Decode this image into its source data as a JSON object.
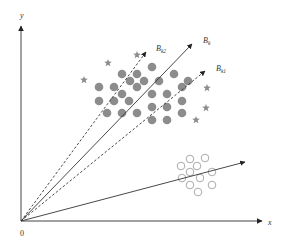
{
  "diagram": {
    "title": "",
    "origin": {
      "x": 21,
      "y": 221
    },
    "axes": {
      "x_label": "x",
      "y_label": "y",
      "origin_label": "0"
    },
    "vectors": [
      {
        "id": "Bk",
        "label": "B",
        "subscript": "k",
        "style": "solid",
        "end": [
          192,
          44
        ],
        "label_pos": [
          203,
          43
        ]
      },
      {
        "id": "Bk2",
        "label": "B",
        "subscript": "k2",
        "style": "dashed",
        "end": [
          146,
          52
        ],
        "label_pos": [
          156,
          51
        ]
      },
      {
        "id": "Bk1",
        "label": "B",
        "subscript": "k1",
        "style": "dashed",
        "end": [
          205,
          71
        ],
        "label_pos": [
          216,
          71
        ]
      },
      {
        "id": "lower",
        "label": "",
        "subscript": "",
        "style": "solid",
        "end": [
          245,
          162
        ],
        "label_pos": null
      }
    ],
    "filled_points": [
      [
        152,
        67
      ],
      [
        122,
        74
      ],
      [
        137,
        74
      ],
      [
        174,
        74
      ],
      [
        130,
        81
      ],
      [
        144,
        81
      ],
      [
        159,
        81
      ],
      [
        188,
        81
      ],
      [
        99,
        87
      ],
      [
        114,
        87
      ],
      [
        137,
        87
      ],
      [
        182,
        87
      ],
      [
        122,
        94
      ],
      [
        152,
        94
      ],
      [
        167,
        94
      ],
      [
        99,
        101
      ],
      [
        114,
        101
      ],
      [
        129,
        101
      ],
      [
        182,
        101
      ],
      [
        152,
        107
      ],
      [
        167,
        107
      ],
      [
        107,
        113
      ],
      [
        122,
        113
      ],
      [
        137,
        113
      ],
      [
        182,
        113
      ],
      [
        152,
        120
      ],
      [
        167,
        120
      ]
    ],
    "star_points": [
      [
        84,
        80
      ],
      [
        108,
        63
      ],
      [
        137,
        55
      ],
      [
        207,
        88
      ],
      [
        206,
        108
      ],
      [
        196,
        120
      ]
    ],
    "hollow_points": [
      [
        181,
        166
      ],
      [
        190,
        159
      ],
      [
        205,
        158
      ],
      [
        197,
        166
      ],
      [
        190,
        172
      ],
      [
        212,
        172
      ],
      [
        182,
        178
      ],
      [
        200,
        178
      ],
      [
        190,
        185
      ],
      [
        212,
        185
      ],
      [
        198,
        192
      ]
    ],
    "colors": {
      "axis": "#444444",
      "filled": "#8c8c8c",
      "star": "#8c8c8c",
      "hollow": "#a0a0a0",
      "label": "#333333"
    }
  }
}
